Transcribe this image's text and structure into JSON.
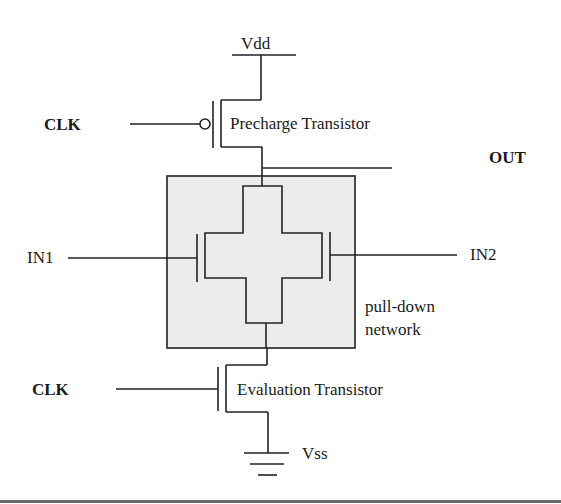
{
  "diagram": {
    "labels": {
      "vdd": "Vdd",
      "vss": "Vss",
      "clk_top": "CLK",
      "clk_bottom": "CLK",
      "out": "OUT",
      "in1": "IN1",
      "in2": "IN2",
      "precharge": "Precharge Transistor",
      "evaluation": "Evaluation Transistor",
      "pdn_line1": "pull-down",
      "pdn_line2": "network"
    },
    "colors": {
      "wire": "#222222",
      "pdn_fill": "#ececec",
      "background": "#ffffff",
      "bottom_rule": "#6a6a6a"
    },
    "components": [
      {
        "id": "precharge",
        "type": "pmos",
        "gate": "CLK",
        "source": "Vdd",
        "drain": "OUT"
      },
      {
        "id": "pdn",
        "type": "pull-down network",
        "inputs": [
          "IN1",
          "IN2"
        ]
      },
      {
        "id": "evaluation",
        "type": "nmos",
        "gate": "CLK",
        "drain": "pdn",
        "source": "Vss"
      }
    ]
  }
}
